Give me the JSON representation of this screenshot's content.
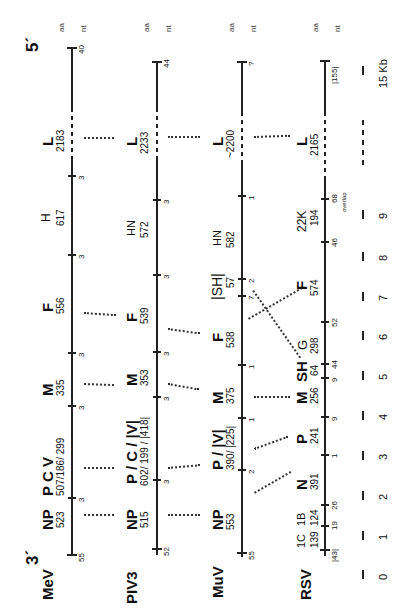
{
  "figure": {
    "orientation": "rotated 90 degrees counter-clockwise",
    "end_labels": {
      "three_prime": "3´",
      "five_prime": "5´"
    },
    "column_headers": {
      "aa": "aa",
      "nt": "nt"
    },
    "scale": {
      "ticks": [
        "0",
        "1",
        "2",
        "3",
        "4",
        "5",
        "6",
        "7",
        "8",
        "9"
      ],
      "end_label": "15 Kb"
    },
    "viruses": [
      {
        "name": "MeV",
        "start_nt": "55",
        "end_nt": "40",
        "genes": [
          {
            "label": "NP",
            "aa": "523"
          },
          {
            "label": "P   C   V",
            "aa": "507/186/ 299"
          },
          {
            "label": "M",
            "aa": "335"
          },
          {
            "label": "F",
            "aa": "556"
          },
          {
            "label": "H",
            "aa": "617"
          },
          {
            "label": "L",
            "aa": "2183"
          }
        ],
        "intergenic_nt": [
          "3",
          "3",
          "3",
          "3",
          "3"
        ]
      },
      {
        "name": "PIV3",
        "start_nt": "52",
        "end_nt": "44",
        "genes": [
          {
            "label": "NP",
            "aa": "515"
          },
          {
            "label": "P / C / |V|",
            "aa": "602/ 199 / |418|"
          },
          {
            "label": "M",
            "aa": "353"
          },
          {
            "label": "F",
            "aa": "539"
          },
          {
            "label": "HN",
            "aa": "572"
          },
          {
            "label": "L",
            "aa": "2233"
          }
        ],
        "intergenic_nt": [
          "3",
          "3",
          "3",
          "3",
          "3"
        ]
      },
      {
        "name": "MuV",
        "start_nt": "55",
        "end_nt": "?",
        "genes": [
          {
            "label": "NP",
            "aa": "553"
          },
          {
            "label": "P / |V|",
            "aa": "390/ |225|"
          },
          {
            "label": "M",
            "aa": "375"
          },
          {
            "label": "F",
            "aa": "538"
          },
          {
            "label": "|SH|",
            "aa": "57"
          },
          {
            "label": "HN",
            "aa": "582"
          },
          {
            "label": "L",
            "aa": "~2200"
          }
        ],
        "intergenic_nt": [
          "2",
          "1",
          "1",
          "7",
          "2",
          "1"
        ]
      },
      {
        "name": "RSV",
        "start_nt": "|43|",
        "end_nt": "|155|",
        "genes": [
          {
            "label": "1C",
            "aa": "139"
          },
          {
            "label": "1B",
            "aa": "124"
          },
          {
            "label": "N",
            "aa": "391"
          },
          {
            "label": "P",
            "aa": "241"
          },
          {
            "label": "M",
            "aa": "256"
          },
          {
            "label": "SH",
            "aa": "64"
          },
          {
            "label": "G",
            "aa": "298"
          },
          {
            "label": "F",
            "aa": "574"
          },
          {
            "label": "22K",
            "aa": "194"
          },
          {
            "label": "L",
            "aa": "2165"
          }
        ],
        "intergenic_nt": [
          "19",
          "26",
          "1",
          "9",
          "9",
          "44",
          "52",
          "46",
          "68"
        ],
        "overlap_label": "overlap"
      }
    ]
  }
}
